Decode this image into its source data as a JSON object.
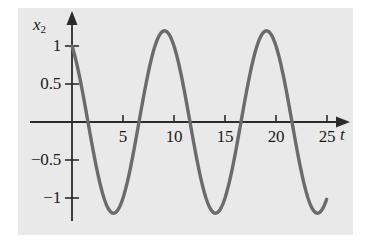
{
  "figure": {
    "background_color": "#e9e9e9",
    "page_color": "#ffffff",
    "curve_color": "#6b6b6b",
    "axis_color": "#2b2b2b"
  },
  "axes": {
    "y_axis_name": "x",
    "y_axis_subscript": "2",
    "x_axis_name": "t"
  },
  "ticks": {
    "x": [
      {
        "value": 5,
        "label": "5"
      },
      {
        "value": 10,
        "label": "10"
      },
      {
        "value": 15,
        "label": "15"
      },
      {
        "value": 20,
        "label": "20"
      },
      {
        "value": 25,
        "label": "25"
      }
    ],
    "y": [
      {
        "value": 1.0,
        "label": "1"
      },
      {
        "value": 0.5,
        "label": "0.5"
      },
      {
        "value": -0.5,
        "label": "−0.5"
      },
      {
        "value": -1.0,
        "label": "−1"
      }
    ]
  },
  "chart_data": {
    "type": "line",
    "title": "",
    "xlabel": "t",
    "ylabel": "x2",
    "xlim": [
      0,
      26.5
    ],
    "ylim": [
      -1.35,
      1.35
    ],
    "grid": false,
    "legend": null,
    "annotations": [],
    "series": [
      {
        "name": "x2(t)",
        "color": "#6b6b6b",
        "description": "Sinusoid of amplitude about 1.2 and period about 10 time units, starting at x2 = 1 at t = 0 and decreasing; plotted from t = 0 to t = 25.",
        "amplitude": 1.2,
        "period": 10.0,
        "value_at_t0": 1.0,
        "x": [
          0,
          0.5,
          1,
          1.5,
          2,
          2.5,
          3,
          3.5,
          4,
          4.5,
          5,
          5.5,
          6,
          6.5,
          7,
          7.5,
          8,
          8.5,
          9,
          9.5,
          10,
          10.5,
          11,
          11.5,
          12,
          12.5,
          13,
          13.5,
          14,
          14.5,
          15,
          15.5,
          16,
          16.5,
          17,
          17.5,
          18,
          18.5,
          19,
          19.5,
          20,
          20.5,
          21,
          21.5,
          22,
          22.5,
          23,
          23.5,
          24,
          24.5,
          25
        ],
        "y": [
          1.0,
          0.85,
          0.63,
          0.35,
          0.05,
          -0.27,
          -0.57,
          -0.83,
          -1.03,
          -1.16,
          -1.2,
          -1.16,
          -1.03,
          -0.83,
          -0.57,
          -0.27,
          0.05,
          0.35,
          0.63,
          0.85,
          1.0,
          1.08,
          1.08,
          1.0,
          0.85,
          0.63,
          0.35,
          0.05,
          -0.27,
          -0.57,
          -0.83,
          -1.03,
          -1.16,
          -1.2,
          -1.16,
          -1.03,
          -0.83,
          -0.57,
          -0.27,
          0.05,
          0.35,
          0.63,
          0.85,
          1.0,
          1.08,
          1.08,
          1.0,
          0.85,
          0.63,
          0.35,
          0.05
        ],
        "peaks": [
          {
            "t": 0.0,
            "value": 1.0
          },
          {
            "t": 9.2,
            "value": 1.2
          },
          {
            "t": 19.2,
            "value": 1.2
          }
        ],
        "troughs": [
          {
            "t": 4.2,
            "value": -1.2
          },
          {
            "t": 14.2,
            "value": -1.2
          },
          {
            "t": 24.2,
            "value": -1.2
          }
        ],
        "zero_crossings": [
          2.2,
          6.7,
          11.7,
          16.7,
          21.7
        ]
      }
    ]
  }
}
